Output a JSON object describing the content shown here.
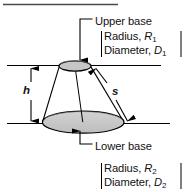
{
  "figure": {
    "top_rule": true,
    "background_color": "#ffffff",
    "line_color": "#000000",
    "fill_color": "#c9c9c9",
    "annotations": {
      "upper_base": {
        "label": "Upper base",
        "leader": "down-arrow-to-upper-ellipse",
        "specs": [
          {
            "name": "Radius,",
            "symbol": "R",
            "subscript": "1"
          },
          {
            "name": "Diameter,",
            "symbol": "D",
            "subscript": "1"
          }
        ]
      },
      "lower_base": {
        "label": "Lower base",
        "leader": "up-arrow-to-lower-ellipse",
        "specs": [
          {
            "name": "Radius,",
            "symbol": "R",
            "subscript": "2"
          },
          {
            "name": "Diameter,",
            "symbol": "D",
            "subscript": "2"
          }
        ]
      },
      "height": {
        "symbol": "h",
        "meaning": "height",
        "dimension": "vertical-double-arrow"
      },
      "slant": {
        "symbol": "s",
        "meaning": "slant height",
        "dimension": "diagonal-double-arrow"
      }
    }
  }
}
